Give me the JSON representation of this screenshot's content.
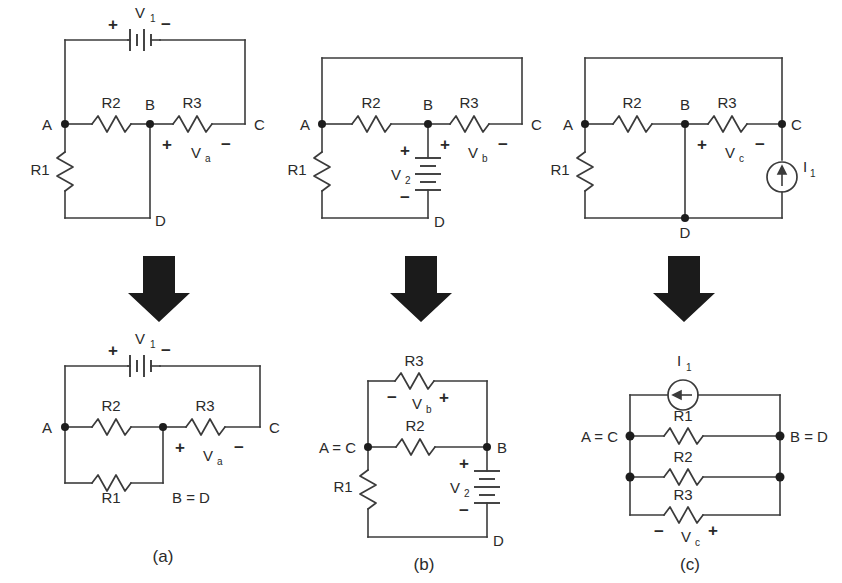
{
  "figure": {
    "background": "#ffffff",
    "line_color": "#3b3b3b",
    "node_color": "#1d1d1d",
    "arrow_color": "#1b1b1b",
    "panel_labels": [
      "(a)",
      "(b)",
      "(c)"
    ]
  },
  "panels": [
    {
      "id": "a",
      "label": "(a)",
      "top": {
        "name": "circuit-a-before",
        "nodes": [
          "A",
          "B",
          "C",
          "D"
        ],
        "components": [
          {
            "name": "V1",
            "type": "battery",
            "plus": "+",
            "minus": "−",
            "orientation": "horizontal",
            "label": "V",
            "sub": "1"
          },
          {
            "name": "R2",
            "type": "resistor",
            "orientation": "horizontal",
            "label": "R2"
          },
          {
            "name": "R3",
            "type": "resistor",
            "orientation": "horizontal",
            "label": "R3"
          },
          {
            "name": "R1",
            "type": "resistor",
            "orientation": "vertical",
            "label": "R1"
          },
          {
            "name": "Va",
            "type": "voltage-annotation",
            "label": "V",
            "sub": "a",
            "plus": "+",
            "minus": "−"
          }
        ]
      },
      "bottom": {
        "name": "circuit-a-after",
        "nodes": [
          "A",
          "C",
          "B = D"
        ],
        "components": [
          {
            "name": "V1",
            "type": "battery",
            "plus": "+",
            "minus": "−",
            "orientation": "horizontal",
            "label": "V",
            "sub": "1"
          },
          {
            "name": "R2",
            "type": "resistor",
            "orientation": "horizontal",
            "label": "R2"
          },
          {
            "name": "R3",
            "type": "resistor",
            "orientation": "horizontal",
            "label": "R3"
          },
          {
            "name": "R1",
            "type": "resistor",
            "orientation": "horizontal",
            "label": "R1"
          },
          {
            "name": "Va",
            "type": "voltage-annotation",
            "label": "V",
            "sub": "a",
            "plus": "+",
            "minus": "−"
          }
        ]
      }
    },
    {
      "id": "b",
      "label": "(b)",
      "top": {
        "name": "circuit-b-before",
        "nodes": [
          "A",
          "B",
          "C",
          "D"
        ],
        "components": [
          {
            "name": "R2",
            "type": "resistor",
            "orientation": "horizontal",
            "label": "R2"
          },
          {
            "name": "R3",
            "type": "resistor",
            "orientation": "horizontal",
            "label": "R3"
          },
          {
            "name": "R1",
            "type": "resistor",
            "orientation": "vertical",
            "label": "R1"
          },
          {
            "name": "V2",
            "type": "battery",
            "plus": "+",
            "minus": "−",
            "orientation": "vertical",
            "label": "V",
            "sub": "2"
          },
          {
            "name": "Vb",
            "type": "voltage-annotation",
            "label": "V",
            "sub": "b",
            "plus": "+",
            "minus": "−"
          }
        ]
      },
      "bottom": {
        "name": "circuit-b-after",
        "nodes": [
          "A = C",
          "B",
          "D"
        ],
        "components": [
          {
            "name": "R3",
            "type": "resistor",
            "orientation": "horizontal",
            "label": "R3"
          },
          {
            "name": "R2",
            "type": "resistor",
            "orientation": "horizontal",
            "label": "R2"
          },
          {
            "name": "R1",
            "type": "resistor",
            "orientation": "vertical",
            "label": "R1"
          },
          {
            "name": "V2",
            "type": "battery",
            "plus": "+",
            "minus": "−",
            "orientation": "vertical",
            "label": "V",
            "sub": "2"
          },
          {
            "name": "Vb",
            "type": "voltage-annotation",
            "label": "V",
            "sub": "b",
            "plus": "+",
            "minus": "−"
          }
        ]
      }
    },
    {
      "id": "c",
      "label": "(c)",
      "top": {
        "name": "circuit-c-before",
        "nodes": [
          "A",
          "B",
          "C",
          "D"
        ],
        "components": [
          {
            "name": "R2",
            "type": "resistor",
            "orientation": "horizontal",
            "label": "R2"
          },
          {
            "name": "R3",
            "type": "resistor",
            "orientation": "horizontal",
            "label": "R3"
          },
          {
            "name": "R1",
            "type": "resistor",
            "orientation": "vertical",
            "label": "R1"
          },
          {
            "name": "I1",
            "type": "current-source",
            "orientation": "vertical",
            "direction": "up",
            "label": "I",
            "sub": "1"
          },
          {
            "name": "Vc",
            "type": "voltage-annotation",
            "label": "V",
            "sub": "c",
            "plus": "+",
            "minus": "−"
          }
        ]
      },
      "bottom": {
        "name": "circuit-c-after",
        "nodes": [
          "A = C",
          "B = D"
        ],
        "components": [
          {
            "name": "I1",
            "type": "current-source",
            "orientation": "horizontal",
            "direction": "left",
            "label": "I",
            "sub": "1"
          },
          {
            "name": "R1",
            "type": "resistor",
            "orientation": "horizontal",
            "label": "R1"
          },
          {
            "name": "R2",
            "type": "resistor",
            "orientation": "horizontal",
            "label": "R2"
          },
          {
            "name": "R3",
            "type": "resistor",
            "orientation": "horizontal",
            "label": "R3"
          },
          {
            "name": "Vc",
            "type": "voltage-annotation",
            "label": "V",
            "sub": "c",
            "plus": "+",
            "minus": "−"
          }
        ]
      }
    }
  ],
  "labels": {
    "A": "A",
    "B": "B",
    "C": "C",
    "D": "D",
    "A_eq_C": "A = C",
    "B_eq_D": "B = D",
    "R1": "R1",
    "R2": "R2",
    "R3": "R3",
    "V": "V",
    "I": "I",
    "sub1": "1",
    "sub2": "2",
    "suba": "a",
    "subb": "b",
    "subc": "c",
    "plus": "+",
    "minus": "−",
    "panel_a": "(a)",
    "panel_b": "(b)",
    "panel_c": "(c)"
  }
}
